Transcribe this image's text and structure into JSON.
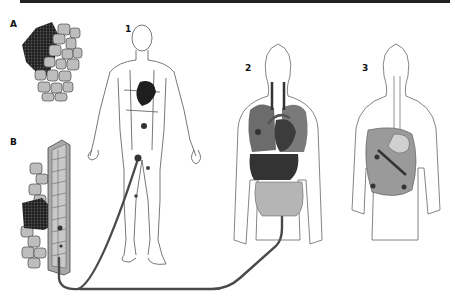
{
  "figure": {
    "panels": [
      {
        "id": "A",
        "label": "A",
        "subject": "tumor-cell-cluster-in-tissue"
      },
      {
        "id": "B",
        "label": "B",
        "subject": "tumor-invading-blood-vessel"
      },
      {
        "id": "1",
        "label": "1",
        "subject": "lymphatic-system-full-body"
      },
      {
        "id": "2",
        "label": "2",
        "subject": "thoracic-and-abdominal-organs"
      },
      {
        "id": "3",
        "label": "3",
        "subject": "abdominal-cavity-peritoneum"
      }
    ]
  },
  "colors": {
    "tumor": "#2a2a2a",
    "tissue_cell": "#bdbdbd",
    "tissue_outline": "#555555",
    "vessel_wall": "#a9a9a9",
    "tube": "#4a4a4a",
    "organ_dark": "#3c3c3c",
    "organ_mid": "#7a7a7a",
    "organ_light": "#b5b5b5",
    "body_outline": "#666666",
    "rule": "#222222"
  }
}
